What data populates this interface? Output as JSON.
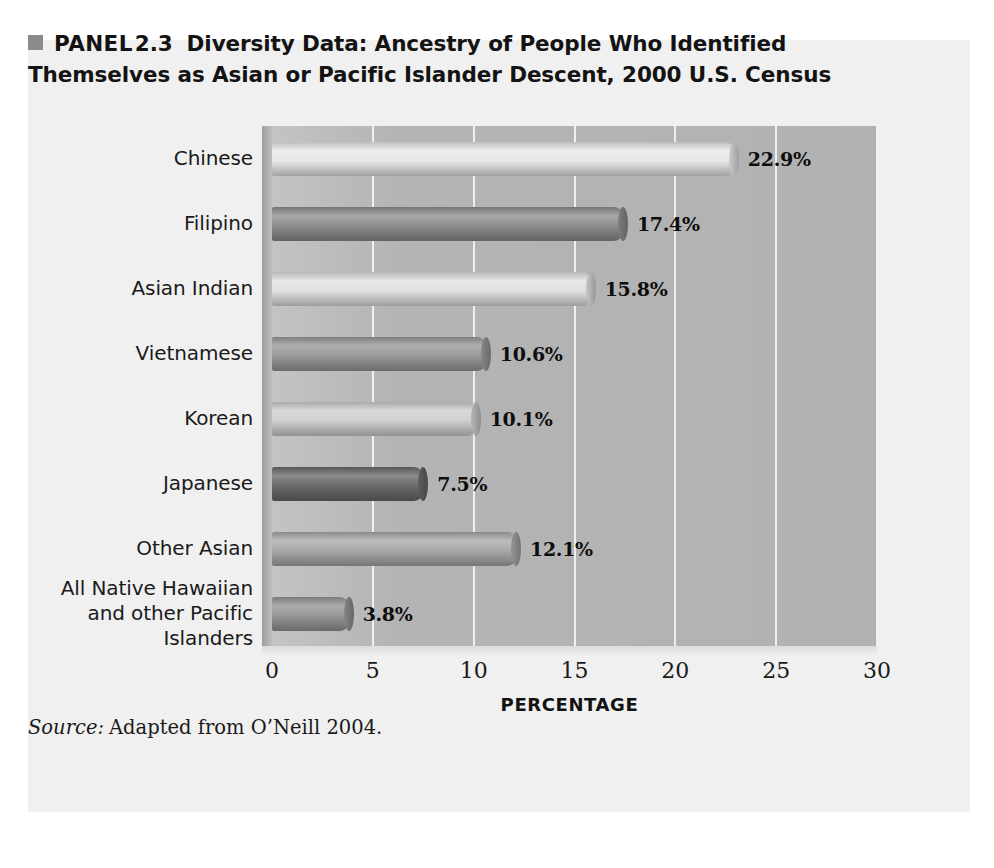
{
  "panel": {
    "marker_icon": "filled-square-icon",
    "marker_color": "#8b8b8b",
    "label": "PANEL",
    "number": "2.3",
    "title": "Diversity Data: Ancestry of People Who Identified Themselves as Asian or Pacific Islander Descent, 2000 U.S. Census",
    "background_color": "#f0f0f0"
  },
  "source": {
    "label": "Source:",
    "text": "Adapted from O’Neill 2004."
  },
  "chart_data": {
    "type": "bar",
    "orientation": "horizontal",
    "title": "Diversity Data: Ancestry of People Who Identified Themselves as Asian or Pacific Islander Descent, 2000 U.S. Census",
    "xlabel": "PERCENTAGE",
    "ylabel": "",
    "xlim": [
      0,
      30
    ],
    "xticks": [
      "0",
      "5",
      "10",
      "15",
      "20",
      "25",
      "30"
    ],
    "grid": true,
    "legend": "none",
    "plot_background_color": "#b4b4b4",
    "categories": [
      "Chinese",
      "Filipino",
      "Asian Indian",
      "Vietnamese",
      "Korean",
      "Japanese",
      "Other Asian",
      "All Native Hawaiian and other Pacific Islanders"
    ],
    "category_lines": [
      [
        "Chinese"
      ],
      [
        "Filipino"
      ],
      [
        "Asian Indian"
      ],
      [
        "Vietnamese"
      ],
      [
        "Korean"
      ],
      [
        "Japanese"
      ],
      [
        "Other Asian"
      ],
      [
        "All Native Hawaiian",
        "and other Pacific",
        "Islanders"
      ]
    ],
    "values": [
      22.9,
      17.4,
      15.8,
      10.6,
      10.1,
      7.5,
      12.1,
      3.8
    ],
    "value_labels": [
      "22.9%",
      "17.4%",
      "15.8%",
      "10.6%",
      "10.1%",
      "7.5%",
      "12.1%",
      "3.8%"
    ],
    "bar_colors": [
      "#e8e8e8",
      "#8e8e8e",
      "#e0e0e0",
      "#9a9a9a",
      "#cfcfcf",
      "#6a6a6a",
      "#a9a9a9",
      "#969696"
    ]
  }
}
